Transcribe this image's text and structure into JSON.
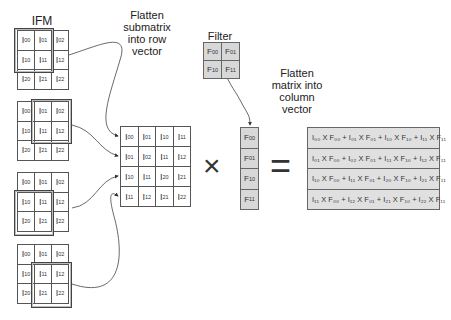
{
  "labels": {
    "ifm": "IFM",
    "flatten_row": [
      "Flatten",
      "submatrix",
      "into row",
      "vector"
    ],
    "filter": "Filter",
    "flatten_col": [
      "Flatten",
      "matrix into",
      "column",
      "vector"
    ]
  },
  "ifm_grids": [
    {
      "cells": [
        [
          "I",
          "00"
        ],
        [
          "I",
          "01"
        ],
        [
          "I",
          "02"
        ],
        [
          "I",
          "10"
        ],
        [
          "I",
          "11"
        ],
        [
          "I",
          "12"
        ],
        [
          "I",
          "20"
        ],
        [
          "I",
          "21"
        ],
        [
          "I",
          "22"
        ]
      ],
      "window": "top-left"
    },
    {
      "cells": [
        [
          "I",
          "00"
        ],
        [
          "I",
          "01"
        ],
        [
          "I",
          "02"
        ],
        [
          "I",
          "10"
        ],
        [
          "I",
          "11"
        ],
        [
          "I",
          "12"
        ],
        [
          "I",
          "20"
        ],
        [
          "I",
          "21"
        ],
        [
          "I",
          "22"
        ]
      ],
      "window": "top-right"
    },
    {
      "cells": [
        [
          "I",
          "00"
        ],
        [
          "I",
          "01"
        ],
        [
          "I",
          "02"
        ],
        [
          "I",
          "10"
        ],
        [
          "I",
          "11"
        ],
        [
          "I",
          "12"
        ],
        [
          "I",
          "20"
        ],
        [
          "I",
          "21"
        ],
        [
          "I",
          "22"
        ]
      ],
      "window": "bottom-left"
    },
    {
      "cells": [
        [
          "I",
          "00"
        ],
        [
          "I",
          "01"
        ],
        [
          "I",
          "02"
        ],
        [
          "I",
          "10"
        ],
        [
          "I",
          "11"
        ],
        [
          "I",
          "12"
        ],
        [
          "I",
          "20"
        ],
        [
          "I",
          "21"
        ],
        [
          "I",
          "22"
        ]
      ],
      "window": "bottom-right"
    }
  ],
  "row_matrix": [
    [
      [
        "I",
        "00"
      ],
      [
        "I",
        "01"
      ],
      [
        "I",
        "10"
      ],
      [
        "I",
        "11"
      ]
    ],
    [
      [
        "I",
        "01"
      ],
      [
        "I",
        "02"
      ],
      [
        "I",
        "11"
      ],
      [
        "I",
        "12"
      ]
    ],
    [
      [
        "I",
        "10"
      ],
      [
        "I",
        "11"
      ],
      [
        "I",
        "20"
      ],
      [
        "I",
        "21"
      ]
    ],
    [
      [
        "I",
        "11"
      ],
      [
        "I",
        "12"
      ],
      [
        "I",
        "21"
      ],
      [
        "I",
        "22"
      ]
    ]
  ],
  "filter": [
    [
      "F",
      "00"
    ],
    [
      "F",
      "01"
    ],
    [
      "F",
      "10"
    ],
    [
      "F",
      "11"
    ]
  ],
  "column_vector": [
    [
      "F",
      "00"
    ],
    [
      "F",
      "01"
    ],
    [
      "F",
      "10"
    ],
    [
      "F",
      "11"
    ]
  ],
  "operators": {
    "multiply": "×",
    "equals": "="
  },
  "result": [
    "I₀₀ X F₀₀ + I₀₁ X F₀₁ + I₁₀ X F₁₀ + I₁₁ X F₁₁",
    "I₀₁ X F₀₀ + I₀₂ X F₀₁ + I₁₁ X F₁₀ + I₁₂ X F₁₁",
    "I₁₀ X F₀₀ + I₁₁ X F₀₁ + I₂₀ X F₁₀ + I₂₁ X F₁₁",
    "I₁₁ X F₀₀ + I₁₂ X F₀₁ + I₂₁ X F₁₀ + I₂₂ X F₁₁"
  ],
  "colors": {
    "line": "#555555",
    "gray_fill": "#d8d8d8",
    "result_fill": "#e0e0e0"
  }
}
